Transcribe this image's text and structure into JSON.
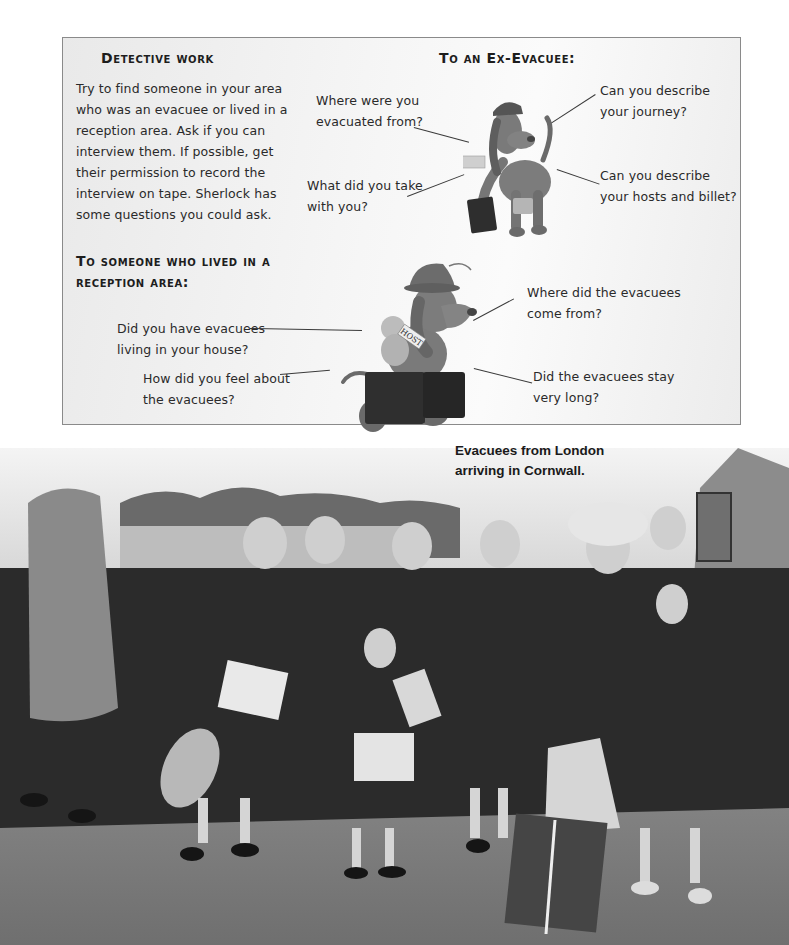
{
  "activity_box": {
    "detective": {
      "title": "Detective work",
      "body": "Try to find someone in your area who was an evacuee or lived in a reception area. Ask if you can interview them. If possible, get their permission to record the interview on tape. Sherlock has some questions you could ask."
    },
    "ex_evacuee": {
      "title": "To an Ex-Evacuee:",
      "questions": [
        "Where were you evacuated from?",
        "What did you take with you?",
        "Can you describe your journey?",
        "Can you describe your hosts and billet?"
      ]
    },
    "reception_area": {
      "title": "To someone who lived in a reception area:",
      "questions": [
        "Did you have evacuees living in your house?",
        "How did you feel about the evacuees?",
        "Where did the evacuees come from?",
        "Did the evacuees stay very long?"
      ]
    },
    "illustrations": {
      "dog_evacuee": "cartoon-dog-with-suitcase-and-label",
      "dog_host": "cartoon-dog-in-hat-with-suitcase-and-teddy",
      "host_sign": "HOST"
    }
  },
  "photo": {
    "subject": "black-and-white photograph of evacuee children with luggage",
    "caption": "Evacuees from London arriving in Cornwall."
  },
  "colors": {
    "page_background": "#ffffff",
    "box_background": "#f2f2f2",
    "box_border": "#8a8a8a",
    "text": "#2a2a2a"
  }
}
